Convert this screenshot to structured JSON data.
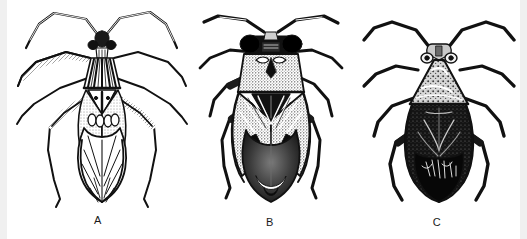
{
  "plate": {
    "title": "Three true bugs in dorsal view",
    "medium": "black and white line engraving",
    "background_color": "#ffffff",
    "ink_color": "#111111",
    "edge_band_color": "#f0f0f0",
    "width": 527,
    "height": 239,
    "panel_count": 3
  },
  "figures": [
    {
      "label": "A",
      "label_x": 98,
      "label_y": 216,
      "caption": "A",
      "description": "Slender long-legged bug with striped pronotum and pale veined wings",
      "body_shading": "outline with hatching",
      "leg_style": "long thin outlined",
      "center_x": 98
    },
    {
      "label": "B",
      "label_x": 270,
      "label_y": 218,
      "caption": "B",
      "description": "Broad stout bug with large dark eyes and stippled hemelytra",
      "body_shading": "dense stipple with dark membrane",
      "leg_style": "medium solid black",
      "center_x": 270
    },
    {
      "label": "C",
      "label_x": 437,
      "label_y": 218,
      "caption": "C",
      "description": "Oval dark bug with pale mottled pronotum and black abdomen",
      "body_shading": "solid black with light pronotum",
      "leg_style": "short solid black",
      "center_x": 437
    }
  ]
}
